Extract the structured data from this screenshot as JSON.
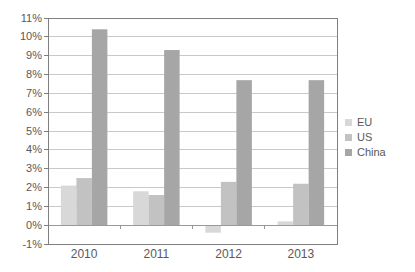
{
  "chart_data": {
    "type": "bar",
    "categories": [
      "2010",
      "2011",
      "2012",
      "2013"
    ],
    "series": [
      {
        "name": "EU",
        "color": "#d8d8d8",
        "values": [
          2.1,
          1.8,
          -0.4,
          0.2
        ]
      },
      {
        "name": "US",
        "color": "#c2c2c2",
        "values": [
          2.5,
          1.6,
          2.3,
          2.2
        ]
      },
      {
        "name": "China",
        "color": "#a6a6a6",
        "values": [
          10.4,
          9.3,
          7.7,
          7.7
        ]
      }
    ],
    "ylim": [
      -1,
      11
    ],
    "ytick_step": 1,
    "ytick_labels": [
      "-1%",
      "0%",
      "1%",
      "2%",
      "3%",
      "4%",
      "5%",
      "6%",
      "7%",
      "8%",
      "9%",
      "10%",
      "11%"
    ],
    "grid": true,
    "legend_position": "right"
  },
  "colors": {
    "background": "#ffffff",
    "gridline": "#c9c9c9",
    "plot_border": "#7f7f7f",
    "zero_axis": "#999999",
    "tick_text": "#595959"
  }
}
